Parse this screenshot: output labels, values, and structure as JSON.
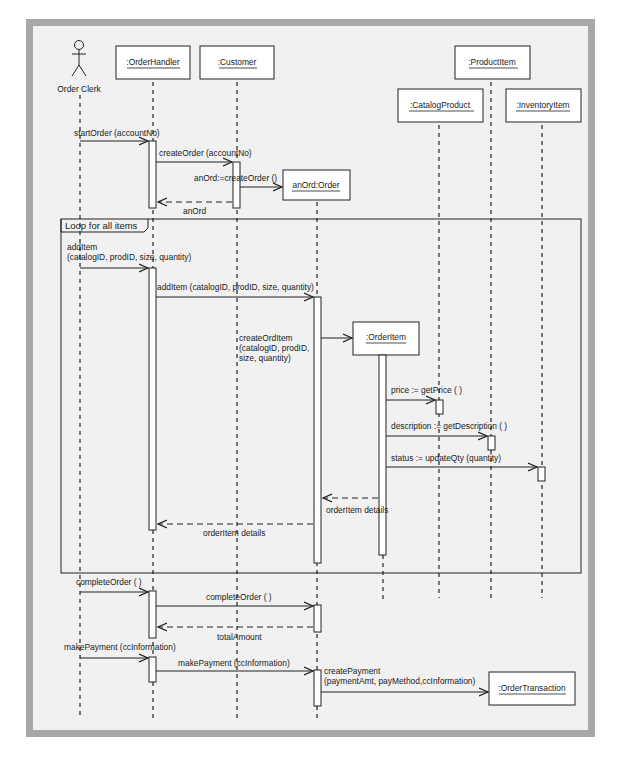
{
  "diagram": {
    "type": "UML sequence diagram",
    "actor": {
      "label": "Order Clerk"
    },
    "lifelines": [
      {
        "id": "orderhandler",
        "label": ":OrderHandler"
      },
      {
        "id": "customer",
        "label": ":Customer"
      },
      {
        "id": "order",
        "label": "anOrd:Order"
      },
      {
        "id": "orderitem",
        "label": ":OrderItem"
      },
      {
        "id": "catalogproduct",
        "label": ":CatalogProduct"
      },
      {
        "id": "productitem",
        "label": ":ProductItem"
      },
      {
        "id": "inventoryitem",
        "label": ":InventoryItem"
      },
      {
        "id": "ordertransaction",
        "label": ":OrderTransaction"
      }
    ],
    "fragment": {
      "label": "Loop for all items"
    },
    "messages": {
      "m1": "startOrder (accountNo)",
      "m2": "createOrder (accountNo)",
      "m3": "anOrd:=createOrder ()",
      "m4": "anOrd",
      "m5_line1": "addItem",
      "m5_line2": "(catalogID, prodID, size, quantity)",
      "m6": "addItem (catalogID, prodID, size, quantity)",
      "m7_line1": "createOrdItem",
      "m7_line2": "(catalogID, prodID,",
      "m7_line3": "size, quantity)",
      "m8": "price := getPrice ( )",
      "m9": "description := getDescription ( )",
      "m10": "status := updateQty (quantity)",
      "m11": "orderItem details",
      "m12": "orderItem details",
      "m13": "completeOrder ( )",
      "m14": "completeOrder ( )",
      "m15": "totalAmount",
      "m16": "makePayment (ccInformation)",
      "m17": "makePayment (ccInformation)",
      "m18_line1": "createPayment",
      "m18_line2": "(paymentAmt, payMethod,ccInformation)"
    }
  }
}
